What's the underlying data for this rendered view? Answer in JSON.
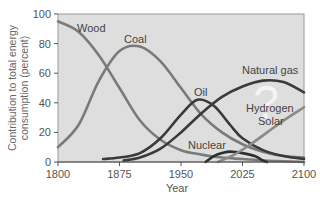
{
  "chart_data": {
    "type": "line",
    "title": "",
    "xlabel": "Year",
    "ylabel": "Contribution to total energy consumption (percent)",
    "ylabel_lines": [
      "Contribution to total energy",
      "consumption (percent)"
    ],
    "xlim": [
      1800,
      2100
    ],
    "ylim": [
      0,
      100
    ],
    "x_ticks": [
      1800,
      1875,
      1950,
      2025,
      2100
    ],
    "x_tick_labels": [
      "1800",
      "1875",
      "1950",
      "2025",
      "2100"
    ],
    "y_ticks": [
      0,
      20,
      40,
      60,
      80,
      100
    ],
    "y_tick_labels": [
      "0",
      "20",
      "40",
      "60",
      "80",
      "100"
    ],
    "grid": false,
    "legend": "inline labels",
    "series": [
      {
        "name": "Wood",
        "color": "#7a7a7a",
        "x": [
          1800,
          1825,
          1850,
          1875,
          1900,
          1925,
          1950,
          1975,
          2000,
          2025,
          2050,
          2075,
          2100
        ],
        "y": [
          95,
          88,
          72,
          50,
          28,
          15,
          8,
          5,
          3,
          2,
          1,
          0.5,
          0
        ]
      },
      {
        "name": "Coal",
        "color": "#7a7a7a",
        "x": [
          1800,
          1825,
          1850,
          1875,
          1900,
          1925,
          1950,
          1975,
          2000,
          2025,
          2050,
          2075,
          2100
        ],
        "y": [
          10,
          25,
          55,
          75,
          78,
          68,
          50,
          32,
          20,
          12,
          7,
          4,
          3
        ]
      },
      {
        "name": "Oil",
        "color": "#3a3a3a",
        "x": [
          1855,
          1875,
          1900,
          1925,
          1950,
          1970,
          1990,
          2010,
          2025,
          2050,
          2075,
          2100
        ],
        "y": [
          2,
          3,
          6,
          16,
          32,
          42,
          38,
          25,
          16,
          8,
          4,
          2
        ]
      },
      {
        "name": "Natural gas",
        "color": "#3a3a3a",
        "x": [
          1880,
          1900,
          1925,
          1950,
          1975,
          2000,
          2025,
          2050,
          2075,
          2100
        ],
        "y": [
          1,
          3,
          9,
          20,
          33,
          44,
          51,
          55,
          54,
          47
        ]
      },
      {
        "name": "Nuclear",
        "color": "#2e2e2e",
        "x": [
          1980,
          1990,
          2000,
          2010,
          2025,
          2040,
          2050,
          2055
        ],
        "y": [
          0,
          4,
          6,
          7,
          6,
          4,
          1,
          0
        ]
      },
      {
        "name": "Hydrogen Solar",
        "color": "#8a8a8a",
        "x": [
          1995,
          2015,
          2035,
          2055,
          2075,
          2100
        ],
        "y": [
          0,
          5,
          12,
          20,
          28,
          37
        ]
      }
    ],
    "annotations": [
      "Wood",
      "Coal",
      "Oil",
      "Natural gas",
      "Nuclear",
      "Hydrogen",
      "Solar",
      "?"
    ]
  },
  "labels": {
    "wood": "Wood",
    "coal": "Coal",
    "oil": "Oil",
    "natural_gas": "Natural gas",
    "nuclear": "Nuclear",
    "hydrogen": "Hydrogen",
    "solar": "Solar",
    "question": "?"
  }
}
